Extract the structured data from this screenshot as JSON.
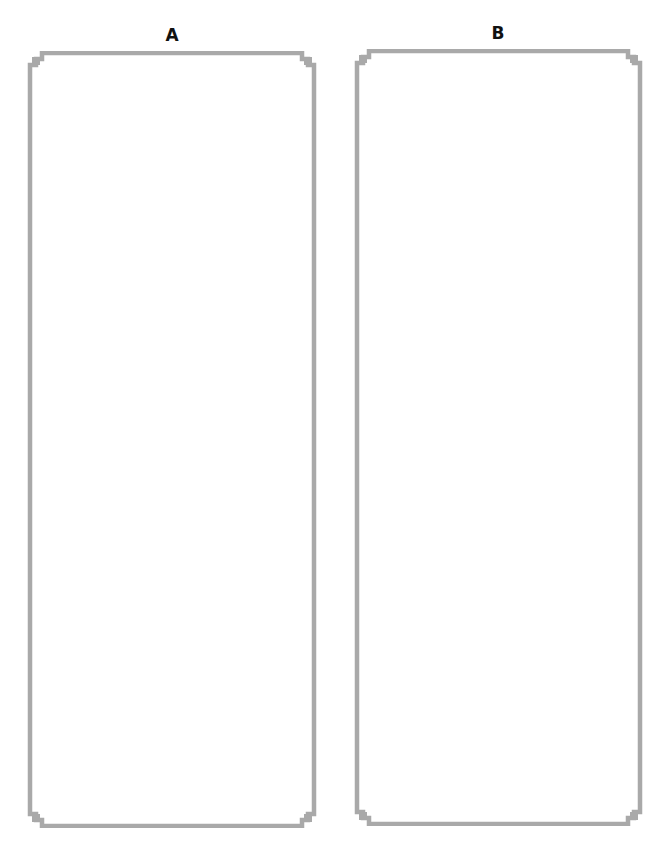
{
  "panels": [
    {
      "label": "A",
      "content": ""
    },
    {
      "label": "B",
      "content": ""
    }
  ],
  "colors": {
    "border": "#a9a9a9",
    "background": "#ffffff",
    "label": "#111111"
  }
}
